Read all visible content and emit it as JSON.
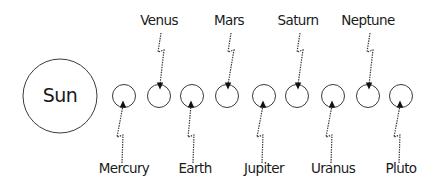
{
  "diagram": {
    "colors": {
      "stroke": "#3a3a3a",
      "text": "#1a1a1a",
      "background": "#ffffff"
    },
    "sun": {
      "label": "Sun",
      "cx": 60,
      "cy": 96,
      "r": 37
    },
    "planets": [
      {
        "name": "Mercury",
        "order": 1,
        "cx": 124,
        "cy": 96,
        "r": 11.5,
        "label_position": "bottom",
        "label_x": 124,
        "label_y": 173
      },
      {
        "name": "Venus",
        "order": 2,
        "cx": 159,
        "cy": 96,
        "r": 11.5,
        "label_position": "top",
        "label_x": 159,
        "label_y": 25
      },
      {
        "name": "Earth",
        "order": 3,
        "cx": 192,
        "cy": 96,
        "r": 11.5,
        "label_position": "bottom",
        "label_x": 195,
        "label_y": 173
      },
      {
        "name": "Mars",
        "order": 4,
        "cx": 227,
        "cy": 96,
        "r": 11.5,
        "label_position": "top",
        "label_x": 229,
        "label_y": 25
      },
      {
        "name": "Jupiter",
        "order": 5,
        "cx": 264,
        "cy": 96,
        "r": 11.5,
        "label_position": "bottom",
        "label_x": 264,
        "label_y": 173
      },
      {
        "name": "Saturn",
        "order": 6,
        "cx": 297,
        "cy": 96,
        "r": 11.5,
        "label_position": "top",
        "label_x": 298,
        "label_y": 25
      },
      {
        "name": "Uranus",
        "order": 7,
        "cx": 333,
        "cy": 96,
        "r": 11.5,
        "label_position": "bottom",
        "label_x": 333,
        "label_y": 173
      },
      {
        "name": "Neptune",
        "order": 8,
        "cx": 368,
        "cy": 96,
        "r": 11.5,
        "label_position": "top",
        "label_x": 368,
        "label_y": 25
      },
      {
        "name": "Pluto",
        "order": 9,
        "cx": 401,
        "cy": 96,
        "r": 11.5,
        "label_position": "bottom",
        "label_x": 401,
        "label_y": 173
      }
    ],
    "connector_style": "dotted zigzag arrow from label to planet"
  }
}
